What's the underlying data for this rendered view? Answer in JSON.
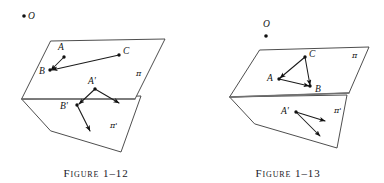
{
  "page": {
    "background_color": "#ffffff",
    "ink_color": "#1a1a1a",
    "fold_color": "#707070"
  },
  "figures": [
    {
      "id": "figure-1-12",
      "caption": "Figure 1–12",
      "center_point": {
        "label": "O",
        "dot_position": "left-of-label"
      },
      "upper_plane": {
        "label": "π"
      },
      "lower_plane": {
        "label": "π'"
      },
      "upper_points": [
        {
          "label": "A",
          "label_side": "above"
        },
        {
          "label": "B",
          "label_side": "left"
        },
        {
          "label": "C",
          "label_side": "right"
        }
      ],
      "lower_points": [
        {
          "label": "A'",
          "label_side": "above"
        },
        {
          "label": "B'",
          "label_side": "left"
        }
      ],
      "vectors": [
        {
          "from": "A",
          "to": "B",
          "arrowhead_at": "B"
        },
        {
          "from": "C",
          "to": "B",
          "arrowhead_at": "B"
        },
        {
          "from": "A-prime",
          "to": "free-1",
          "arrowhead_at": "free-1"
        },
        {
          "from": "A-prime",
          "to": "B-prime",
          "arrowhead_at": "B-prime"
        },
        {
          "from": "B-prime",
          "to": "free-2",
          "arrowhead_at": "free-2"
        }
      ]
    },
    {
      "id": "figure-1-13",
      "caption": "Figure 1–13",
      "center_point": {
        "label": "O",
        "dot_position": "below-label"
      },
      "upper_plane": {
        "label": "π"
      },
      "lower_plane": {
        "label": "π'"
      },
      "upper_points": [
        {
          "label": "C",
          "label_side": "right"
        },
        {
          "label": "A",
          "label_side": "left"
        },
        {
          "label": "B",
          "label_side": "right"
        }
      ],
      "lower_points": [
        {
          "label": "A'",
          "label_side": "left"
        }
      ],
      "vectors": [
        {
          "from": "C",
          "to": "A",
          "arrowhead_at": "A"
        },
        {
          "from": "C",
          "to": "B",
          "arrowhead_at": "B"
        },
        {
          "from": "A",
          "to": "B",
          "arrowhead_at": "B"
        },
        {
          "from": "A-prime",
          "to": "free-1",
          "arrowhead_at": "free-1"
        },
        {
          "from": "A-prime",
          "to": "free-2",
          "arrowhead_at": "free-2"
        }
      ]
    }
  ]
}
